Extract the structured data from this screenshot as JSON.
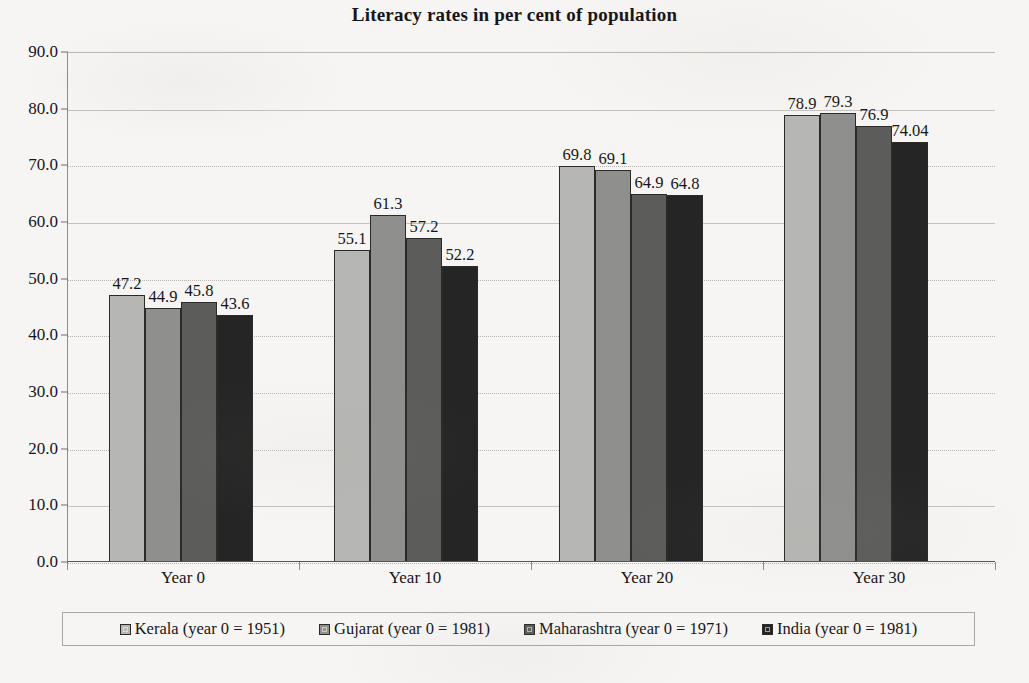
{
  "chart_data": {
    "type": "bar",
    "title": "Literacy rates in per cent of population",
    "xlabel": "",
    "ylabel": "",
    "categories": [
      "Year 0",
      "Year 10",
      "Year 20",
      "Year 30"
    ],
    "series": [
      {
        "name": "Kerala (year 0 = 1951)",
        "values": [
          47.2,
          55.1,
          69.8,
          78.9
        ],
        "color": "#b6b6b4",
        "labels": [
          "47.2",
          "55.1",
          "69.8",
          "78.9"
        ]
      },
      {
        "name": "Gujarat (year 0 = 1981)",
        "values": [
          44.9,
          61.3,
          69.1,
          79.3
        ],
        "color": "#8f8f8d",
        "labels": [
          "44.9",
          "61.3",
          "69.1",
          "79.3"
        ]
      },
      {
        "name": "Maharashtra (year 0 = 1971)",
        "values": [
          45.8,
          57.2,
          64.9,
          76.9
        ],
        "color": "#5c5c5a",
        "labels": [
          "45.8",
          "57.2",
          "64.9",
          "76.9"
        ]
      },
      {
        "name": "India (year 0 = 1981)",
        "values": [
          43.6,
          52.2,
          64.8,
          74.04
        ],
        "color": "#252525",
        "labels": [
          "43.6",
          "52.2",
          "64.8",
          "74.04"
        ]
      }
    ],
    "ylim": [
      0,
      90
    ],
    "ytick_labels": [
      "90.0",
      "80.0",
      "70.0",
      "60.0",
      "50.0",
      "40.0",
      "30.0",
      "20.0",
      "10.0",
      "0.0"
    ],
    "ytick_values": [
      90,
      80,
      70,
      60,
      50,
      40,
      30,
      20,
      10,
      0
    ],
    "grid": true,
    "legend_position": "bottom"
  }
}
